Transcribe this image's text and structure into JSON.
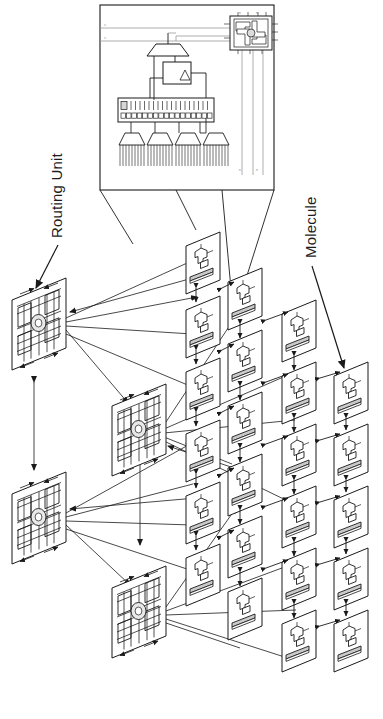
{
  "figure": {
    "background_color": "#ffffff",
    "line_color": "#1a1a1a",
    "shade_color": "#c9c9c9",
    "faint_color": "#8d8d8d",
    "width": 383,
    "height": 719,
    "text_orientation": "rotated -90 degrees (bottom-to-top)"
  },
  "labels": {
    "routing_unit": "Routing Unit",
    "molecule": "Molecule"
  },
  "callouts": [
    {
      "name": "routing-unit-callout",
      "label": "Routing Unit",
      "points_to": "routing-unit-tile-0"
    },
    {
      "name": "molecule-callout",
      "label": "Molecule",
      "points_to": "molecule-tile-r0c3"
    }
  ],
  "inset": {
    "name": "molecule-detail-inset",
    "caption": "",
    "border_color": "#1a1a1a",
    "bus_labels": [
      "n",
      "n",
      "n",
      "n",
      "n",
      "n",
      "n",
      "n"
    ],
    "blocks": [
      {
        "name": "multiplexer",
        "shape": "trapezoid"
      },
      {
        "name": "flip-flop",
        "shape": "rect-with-triangle"
      },
      {
        "name": "configuration-register",
        "shape": "long-bar-with-cells",
        "cells": 18
      },
      {
        "name": "lut-decoder-fanout",
        "shape": "trapezoid-comb",
        "count": 4
      },
      {
        "name": "embedded-routing-unit",
        "shape": "crossbar-pinwheel"
      }
    ]
  },
  "mesh": {
    "name": "3d-mesh",
    "routing_units": [
      {
        "id": "routing-unit-tile-0",
        "row": 0,
        "col": 0
      },
      {
        "id": "routing-unit-tile-1",
        "row": 0,
        "col": 1
      },
      {
        "id": "routing-unit-tile-2",
        "row": 1,
        "col": 0
      },
      {
        "id": "routing-unit-tile-3",
        "row": 1,
        "col": 1
      }
    ],
    "routing_unit_count": 4,
    "molecule_count": 18,
    "molecule_grid": {
      "rows": 5,
      "cols": 4
    },
    "connection_style": "bidirectional arrows"
  }
}
